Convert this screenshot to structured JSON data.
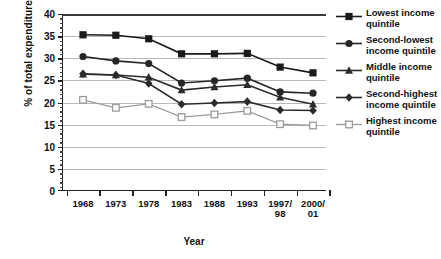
{
  "chart_data": {
    "type": "line",
    "title": "",
    "xlabel": "Year",
    "ylabel": "% of total expenditure",
    "categories": [
      "1968",
      "1973",
      "1978",
      "1983",
      "1988",
      "1993",
      "1997/\n98",
      "2000/\n01"
    ],
    "ylim": [
      0,
      40
    ],
    "yticks": [
      0,
      5,
      10,
      15,
      20,
      25,
      30,
      35,
      40
    ],
    "grid": "horizontal",
    "legend_position": "right",
    "series": [
      {
        "name": "Lowest income quintile",
        "marker": "filled-square",
        "color": "#1a1a1a",
        "values": [
          35.3,
          35.2,
          34.4,
          31.0,
          31.0,
          31.1,
          28.0,
          26.7
        ]
      },
      {
        "name": "Second-lowest income quintile",
        "marker": "filled-circle",
        "color": "#262626",
        "values": [
          30.4,
          29.4,
          28.8,
          24.4,
          24.9,
          25.5,
          22.4,
          22.1
        ]
      },
      {
        "name": "Middle income quintile",
        "marker": "filled-triangle",
        "color": "#2b2b2b",
        "values": [
          26.4,
          26.2,
          25.7,
          22.8,
          23.5,
          24.0,
          21.2,
          19.6
        ]
      },
      {
        "name": "Second-highest income quintile",
        "marker": "filled-diamond",
        "color": "#2b2b2b",
        "values": [
          26.5,
          26.2,
          24.3,
          19.6,
          19.9,
          20.2,
          18.3,
          18.2
        ]
      },
      {
        "name": "Highest income quintile",
        "marker": "open-square",
        "color": "#9a9a9a",
        "values": [
          20.6,
          18.8,
          19.7,
          16.7,
          17.3,
          18.1,
          15.1,
          14.8
        ]
      }
    ]
  },
  "legend": {
    "items": [
      "Lowest income quintile",
      "Second-lowest income quintile",
      "Middle income quintile",
      "Second-highest income quintile",
      "Highest income quintile"
    ]
  }
}
